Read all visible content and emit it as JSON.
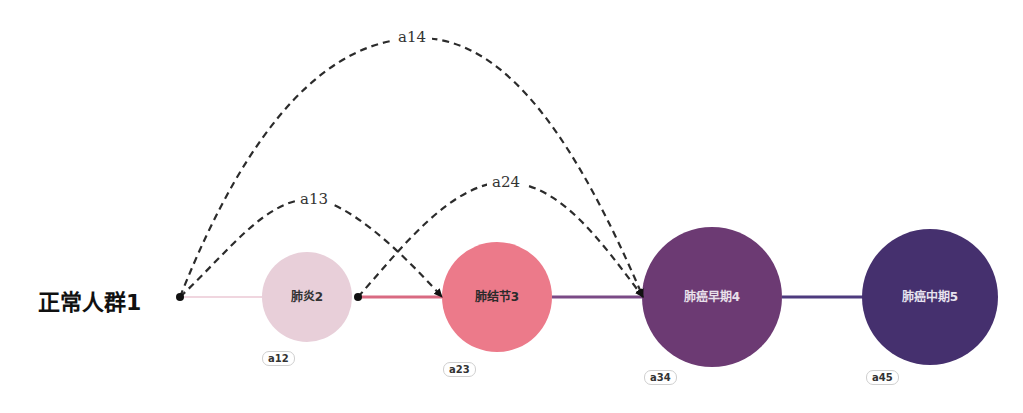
{
  "diagram": {
    "start": {
      "label": "正常人群1"
    },
    "nodes": [
      {
        "id": "2",
        "label": "肺炎2",
        "color": "#e8cfd9",
        "text_color": "#333333",
        "edge_tag": "a12"
      },
      {
        "id": "3",
        "label": "肺结节3",
        "color": "#ec7a8a",
        "text_color": "#2a2a2a",
        "edge_tag": "a23"
      },
      {
        "id": "4",
        "label": "肺癌早期4",
        "color": "#6c3a73",
        "text_color": "#e8e0ea",
        "edge_tag": "a34"
      },
      {
        "id": "5",
        "label": "肺癌中期5",
        "color": "#45306e",
        "text_color": "#e6e2ef",
        "edge_tag": "a45"
      }
    ],
    "skip_arcs": [
      {
        "label": "a13",
        "from": "正常人群1",
        "to": "肺结节3"
      },
      {
        "label": "a14",
        "from": "正常人群1",
        "to": "肺癌早期4"
      },
      {
        "label": "a24",
        "from": "肺炎2",
        "to": "肺癌早期4"
      }
    ],
    "line_colors": {
      "start_to_2": "#f0d6df",
      "2_to_3": "#d96a82",
      "3_to_4": "#7a4a86",
      "4_to_5": "#4d3b7e"
    }
  }
}
